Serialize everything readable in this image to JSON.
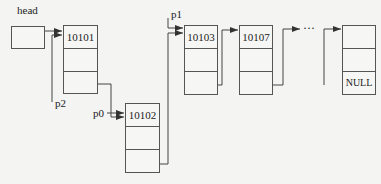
{
  "diagram": {
    "type": "linked-list",
    "head": {
      "label": "head"
    },
    "pointers": [
      {
        "name": "p2",
        "label": "p2",
        "target": "10101"
      },
      {
        "name": "p0",
        "label": "p0",
        "target": "10102"
      },
      {
        "name": "p1",
        "label": "p1",
        "target": "10103"
      }
    ],
    "nodes": [
      {
        "id": "n1",
        "cells": [
          "10101",
          "",
          ""
        ]
      },
      {
        "id": "n2",
        "cells": [
          "10102",
          "",
          ""
        ]
      },
      {
        "id": "n3",
        "cells": [
          "10103",
          "",
          ""
        ]
      },
      {
        "id": "n4",
        "cells": [
          "10107",
          "",
          ""
        ]
      },
      {
        "id": "n5",
        "cells": [
          "",
          "",
          "NULL"
        ]
      }
    ],
    "ellipsis": "···",
    "colors": {
      "line": "#444444",
      "background": "#f4f4f2"
    }
  }
}
